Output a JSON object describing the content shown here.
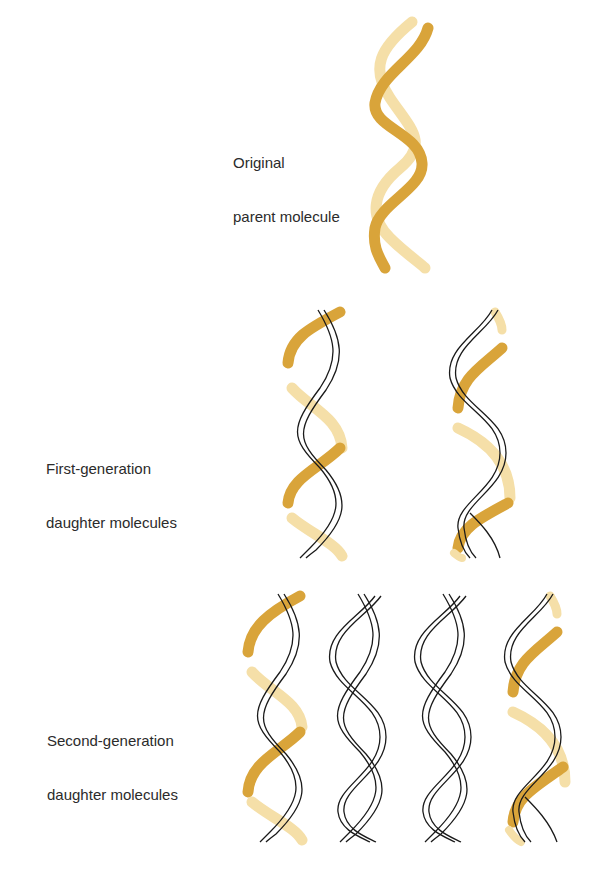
{
  "diagram": {
    "colors": {
      "parent_dark": "#D9A43A",
      "parent_light": "#F5DFA8",
      "new_strand": "#1a1a1a",
      "background": "#FFFFFF"
    },
    "rows": [
      {
        "id": "original",
        "label_line1": "Original",
        "label_line2": "parent molecule",
        "molecules": [
          {
            "strand_a": "parent-dark",
            "strand_b": "parent-light"
          }
        ]
      },
      {
        "id": "first-generation",
        "label_line1": "First-generation",
        "label_line2": "daughter molecules",
        "molecules": [
          {
            "strand_a": "parent-dark+light",
            "strand_b": "new"
          },
          {
            "strand_a": "new",
            "strand_b": "parent-dark+light"
          }
        ]
      },
      {
        "id": "second-generation",
        "label_line1": "Second-generation",
        "label_line2": "daughter molecules",
        "molecules": [
          {
            "strand_a": "parent-dark+light",
            "strand_b": "new"
          },
          {
            "strand_a": "new",
            "strand_b": "new"
          },
          {
            "strand_a": "new",
            "strand_b": "new"
          },
          {
            "strand_a": "new",
            "strand_b": "parent-dark+light"
          }
        ]
      }
    ]
  }
}
